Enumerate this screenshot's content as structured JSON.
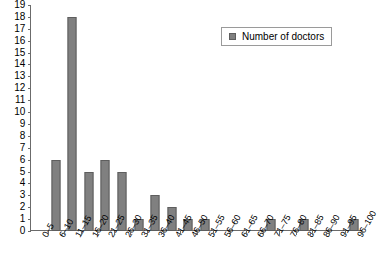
{
  "chart_data": {
    "type": "bar",
    "title": "",
    "subtitle": "",
    "xlabel": "",
    "ylabel": "",
    "ylim": [
      0,
      19
    ],
    "ytick_step": 1,
    "grid": false,
    "legend_position": "top-right",
    "legend": [
      "Number of doctors"
    ],
    "categories": [
      "0–5",
      "6–10",
      "11–15",
      "16–20",
      "21–25",
      "26–30",
      "31–35",
      "36–40",
      "41–45",
      "46–50",
      "51–55",
      "56–60",
      "61–65",
      "66–70",
      "71–75",
      "76–80",
      "81–85",
      "86–90",
      "91–95",
      "96–100"
    ],
    "values": [
      0,
      6,
      18,
      5,
      6,
      5,
      1,
      3,
      2,
      1,
      1,
      0,
      0,
      0,
      1,
      0,
      1,
      0,
      0,
      1
    ],
    "ytick_labels": [
      "19",
      "18",
      "17",
      "16",
      "15",
      "14",
      "13",
      "12",
      "11",
      "10",
      "9",
      "8",
      "7",
      "6",
      "5",
      "4",
      "3",
      "2",
      "1",
      "0"
    ],
    "series": [
      {
        "name": "Number of doctors",
        "color": "#808080",
        "values": [
          0,
          6,
          18,
          5,
          6,
          5,
          1,
          3,
          2,
          1,
          1,
          0,
          0,
          0,
          1,
          0,
          1,
          0,
          0,
          1
        ]
      }
    ]
  },
  "colors": {
    "bar_fill": "#808080",
    "bar_stroke": "#5e5e5e",
    "axis": "#6b6b6b",
    "background": "#ffffff",
    "legend_border": "#9a9a9a"
  }
}
